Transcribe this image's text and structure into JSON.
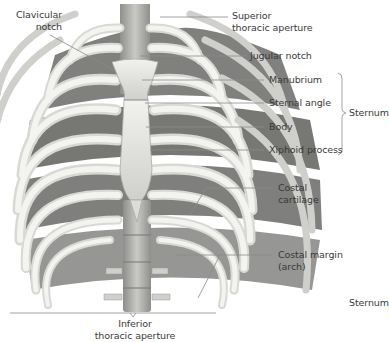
{
  "figure": {
    "colors": {
      "bone": "#e9e9e6",
      "bone_shadow": "#b9b9b5",
      "intercostal_space": "#5c5c5a",
      "vertebra": "#a9a9a5",
      "leader_line": "#8a8a8a",
      "label_text": "#3a3a3a",
      "background": "#ffffff"
    }
  },
  "labels": {
    "clavicular_notch": {
      "line1": "Clavicular",
      "line2": "notch"
    },
    "superior_thoracic_aperture": {
      "line1": "Superior",
      "line2": "thoracic aperture"
    },
    "jugular_notch": "Jugular notch",
    "manubrium": "Manubrium",
    "sternal_angle": "Sternal angle",
    "body": "Body",
    "xiphoid_process": "Xiphoid process",
    "sternum_group": "Sternum",
    "costal_cartilage": {
      "line1": "Costal",
      "line2": "cartilage"
    },
    "costal_margin": {
      "line1": "Costal margin",
      "line2": "(arch)"
    },
    "inferior_thoracic_aperture": {
      "line1": "Inferior",
      "line2": "thoracic aperture"
    },
    "stray_sternum": "Sternum"
  }
}
